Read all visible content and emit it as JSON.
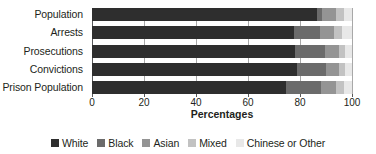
{
  "chart_data": {
    "type": "bar",
    "orientation": "horizontal",
    "stacked": true,
    "title": "",
    "xlabel": "Percentages",
    "ylabel": "",
    "xlim": [
      0,
      100
    ],
    "xticks": [
      0,
      20,
      40,
      60,
      80,
      100
    ],
    "grid": true,
    "legend_position": "bottom",
    "categories": [
      "Population",
      "Arrests",
      "Prosecutions",
      "Convictions",
      "Prison Population"
    ],
    "series": [
      {
        "name": "White",
        "color": "#2e2e2e",
        "values": [
          86.5,
          77.5,
          78.0,
          79.0,
          74.5
        ]
      },
      {
        "name": "Black",
        "color": "#6b6b6b",
        "values": [
          2.0,
          10.0,
          11.5,
          11.0,
          13.5
        ]
      },
      {
        "name": "Asian",
        "color": "#949494",
        "values": [
          5.5,
          5.5,
          5.5,
          5.0,
          6.0
        ]
      },
      {
        "name": "Mixed",
        "color": "#c2c2c2",
        "values": [
          3.0,
          3.0,
          2.5,
          2.5,
          3.0
        ]
      },
      {
        "name": "Chinese or Other",
        "color": "#e8e8e8",
        "values": [
          3.0,
          4.0,
          2.5,
          2.5,
          3.0
        ]
      }
    ]
  },
  "axis": {
    "x_title": "Percentages",
    "tick_labels": [
      "0",
      "20",
      "40",
      "60",
      "80",
      "100"
    ]
  },
  "legend": {
    "items": [
      {
        "label": "White"
      },
      {
        "label": "Black"
      },
      {
        "label": "Asian"
      },
      {
        "label": "Mixed"
      },
      {
        "label": "Chinese or Other"
      }
    ]
  },
  "colors": {
    "white_series": "#2e2e2e",
    "black_series": "#6b6b6b",
    "asian_series": "#949494",
    "mixed_series": "#c2c2c2",
    "other_series": "#e8e8e8",
    "axis": "#58595b",
    "grid": "#a8a8a8",
    "text": "#231f20"
  }
}
